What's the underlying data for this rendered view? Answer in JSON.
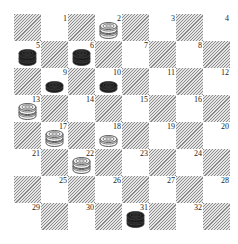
{
  "board": {
    "title": "Checkers board diagram",
    "size": 8,
    "origin_px": [
      14,
      14
    ],
    "square_px": 27,
    "colors": {
      "light": "#ffffff",
      "dark_hatch": "#8a8a8a",
      "black_piece": "#1a1a1a",
      "white_piece": "#f2f2f2",
      "outline": "#333333"
    },
    "squares": [
      {
        "n": "1"
      },
      {
        "n": "2"
      },
      {
        "n": "3"
      },
      {
        "n": "4"
      },
      {
        "n": "5"
      },
      {
        "n": "6"
      },
      {
        "n": "7"
      },
      {
        "n": "8"
      },
      {
        "n": "9"
      },
      {
        "n": "10"
      },
      {
        "n": "11"
      },
      {
        "n": "12"
      },
      {
        "n": "13"
      },
      {
        "n": "14"
      },
      {
        "n": "15"
      },
      {
        "n": "16"
      },
      {
        "n": "17"
      },
      {
        "n": "18"
      },
      {
        "n": "19"
      },
      {
        "n": "20"
      },
      {
        "n": "21"
      },
      {
        "n": "22"
      },
      {
        "n": "23"
      },
      {
        "n": "24"
      },
      {
        "n": "25"
      },
      {
        "n": "26"
      },
      {
        "n": "27"
      },
      {
        "n": "28"
      },
      {
        "n": "29"
      },
      {
        "n": "30"
      },
      {
        "n": "31"
      },
      {
        "n": "32"
      }
    ],
    "pieces": [
      {
        "square": 2,
        "color": "white",
        "king": true
      },
      {
        "square": 5,
        "color": "black",
        "king": true
      },
      {
        "square": 6,
        "color": "black",
        "king": true
      },
      {
        "square": 9,
        "color": "black",
        "king": false
      },
      {
        "square": 10,
        "color": "black",
        "king": false
      },
      {
        "square": 13,
        "color": "white",
        "king": true
      },
      {
        "square": 17,
        "color": "white",
        "king": true
      },
      {
        "square": 18,
        "color": "white",
        "king": false
      },
      {
        "square": 22,
        "color": "white",
        "king": true
      },
      {
        "square": 31,
        "color": "black",
        "king": true
      }
    ]
  }
}
